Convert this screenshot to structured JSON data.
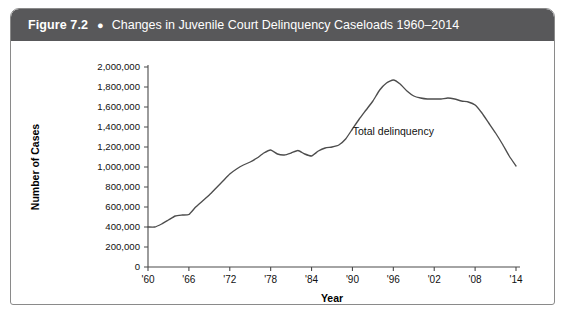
{
  "figure": {
    "number": "Figure 7.2",
    "bullet": "●",
    "title": "Changes in Juvenile Court Delinquency Caseloads 1960–2014",
    "header_color": "#58585a"
  },
  "chart_data": {
    "type": "line",
    "title": "Changes in Juvenile Court Delinquency Caseloads 1960–2014",
    "xlabel": "Year",
    "ylabel": "Number of Cases",
    "xlim": [
      1960,
      2014
    ],
    "ylim": [
      0,
      2000000
    ],
    "grid": false,
    "legend_position": "inline-annotation",
    "line_color": "#4d4d4d",
    "y_ticks": [
      0,
      200000,
      400000,
      600000,
      800000,
      1000000,
      1200000,
      1400000,
      1600000,
      1800000,
      2000000
    ],
    "y_tick_labels": [
      "0",
      "200,000",
      "400,000",
      "600,000",
      "800,000",
      "1,000,000",
      "1,200,000",
      "1,400,000",
      "1,600,000",
      "1,800,000",
      "2,000,000"
    ],
    "x_ticks": [
      1960,
      1966,
      1972,
      1978,
      1984,
      1990,
      1996,
      2002,
      2008,
      2014
    ],
    "x_tick_labels": [
      "'60",
      "'66",
      "'72",
      "'78",
      "'84",
      "'90",
      "'96",
      "'02",
      "'08",
      "'14"
    ],
    "series": [
      {
        "name": "Total delinquency",
        "annotation": "Total delinquency",
        "annotation_x": 1996,
        "annotation_y": 1320000,
        "x": [
          1960,
          1961,
          1962,
          1963,
          1964,
          1965,
          1966,
          1967,
          1968,
          1969,
          1970,
          1971,
          1972,
          1973,
          1974,
          1975,
          1976,
          1977,
          1978,
          1979,
          1980,
          1981,
          1982,
          1983,
          1984,
          1985,
          1986,
          1987,
          1988,
          1989,
          1990,
          1991,
          1992,
          1993,
          1994,
          1995,
          1996,
          1997,
          1998,
          1999,
          2000,
          2001,
          2002,
          2003,
          2004,
          2005,
          2006,
          2007,
          2008,
          2009,
          2010,
          2011,
          2012,
          2013,
          2014
        ],
        "values": [
          400000,
          400000,
          430000,
          470000,
          510000,
          520000,
          525000,
          600000,
          660000,
          720000,
          790000,
          860000,
          930000,
          980000,
          1020000,
          1050000,
          1090000,
          1140000,
          1170000,
          1130000,
          1120000,
          1140000,
          1165000,
          1130000,
          1110000,
          1160000,
          1190000,
          1200000,
          1220000,
          1280000,
          1380000,
          1480000,
          1570000,
          1660000,
          1770000,
          1840000,
          1870000,
          1830000,
          1760000,
          1710000,
          1690000,
          1680000,
          1680000,
          1680000,
          1690000,
          1680000,
          1660000,
          1650000,
          1620000,
          1540000,
          1440000,
          1340000,
          1230000,
          1110000,
          1010000
        ]
      }
    ]
  }
}
